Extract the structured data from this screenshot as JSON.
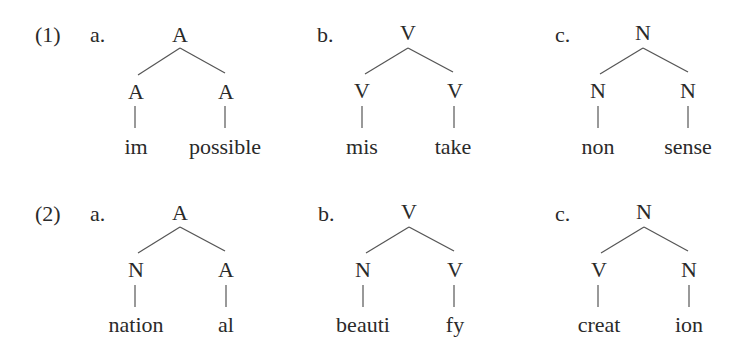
{
  "examples": [
    {
      "number": "(1)",
      "trees": [
        {
          "letter": "a.",
          "root": "A",
          "left": {
            "cat": "A",
            "word": "im"
          },
          "right": {
            "cat": "A",
            "word": "possible"
          }
        },
        {
          "letter": "b.",
          "root": "V",
          "left": {
            "cat": "V",
            "word": "mis"
          },
          "right": {
            "cat": "V",
            "word": "take"
          }
        },
        {
          "letter": "c.",
          "root": "N",
          "left": {
            "cat": "N",
            "word": "non"
          },
          "right": {
            "cat": "N",
            "word": "sense"
          }
        }
      ]
    },
    {
      "number": "(2)",
      "trees": [
        {
          "letter": "a.",
          "root": "A",
          "left": {
            "cat": "N",
            "word": "nation"
          },
          "right": {
            "cat": "A",
            "word": "al"
          }
        },
        {
          "letter": "b.",
          "root": "V",
          "left": {
            "cat": "N",
            "word": "beauti"
          },
          "right": {
            "cat": "V",
            "word": "fy"
          }
        },
        {
          "letter": "c.",
          "root": "N",
          "left": {
            "cat": "V",
            "word": "creat"
          },
          "right": {
            "cat": "N",
            "word": "ion"
          }
        }
      ]
    }
  ]
}
